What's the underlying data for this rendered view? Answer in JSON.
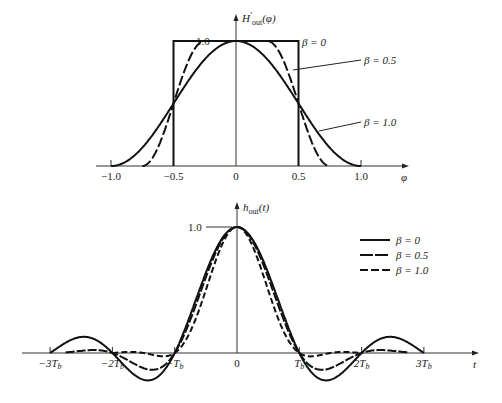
{
  "chart_data": [
    {
      "type": "line",
      "title": "",
      "ylabel": "H'out(φ)",
      "xlabel": "φ",
      "xlim": [
        -1.0,
        1.0
      ],
      "ylim": [
        0,
        1.0
      ],
      "x_ticks": [
        "-1.0",
        "-0.5",
        "0",
        "0.5",
        "1.0"
      ],
      "y_ticks": [
        "1.0"
      ],
      "grid": false,
      "series": [
        {
          "name": "β = 0",
          "style": "solid",
          "x": [
            -1.0,
            -0.5,
            -0.5,
            0,
            0.5,
            0.5,
            1.0
          ],
          "values": [
            0,
            0,
            1,
            1,
            1,
            0,
            0
          ]
        },
        {
          "name": "β = 0.5",
          "style": "long-dash",
          "x": [
            -0.75,
            -0.625,
            -0.5,
            -0.375,
            -0.25,
            0,
            0.25,
            0.375,
            0.5,
            0.625,
            0.75
          ],
          "values": [
            0,
            0.146,
            0.5,
            0.854,
            1,
            1,
            1,
            0.854,
            0.5,
            0.146,
            0
          ]
        },
        {
          "name": "β = 1.0",
          "style": "solid",
          "x": [
            -1.0,
            -0.75,
            -0.5,
            -0.25,
            0,
            0.25,
            0.5,
            0.75,
            1.0
          ],
          "values": [
            0,
            0.146,
            0.5,
            0.854,
            1,
            0.854,
            0.5,
            0.146,
            0
          ]
        }
      ],
      "annotations": [
        "β = 0",
        "β = 0.5",
        "β = 1.0"
      ]
    },
    {
      "type": "line",
      "title": "",
      "ylabel": "hout(t)",
      "xlabel": "t",
      "xlim": [
        -3,
        3
      ],
      "ylim": [
        -0.25,
        1.0
      ],
      "x_ticks": [
        "-3Tb",
        "-2Tb",
        "-Tb",
        "0",
        "Tb",
        "2Tb",
        "3Tb"
      ],
      "y_ticks": [
        "1.0"
      ],
      "grid": false,
      "legend_position": "upper right",
      "series": [
        {
          "name": "β = 0",
          "style": "solid",
          "x": [
            -3,
            -2.5,
            -2,
            -1.5,
            -1,
            -0.5,
            0,
            0.5,
            1,
            1.5,
            2,
            2.5,
            3
          ],
          "values": [
            0,
            0.127,
            0,
            -0.212,
            0,
            0.637,
            1,
            0.637,
            0,
            -0.212,
            0,
            0.127,
            0
          ]
        },
        {
          "name": "β = 0.5",
          "style": "long-dash",
          "x": [
            -2.5,
            -2,
            -1.5,
            -1,
            -0.5,
            0,
            0.5,
            1,
            1.5,
            2,
            2.5
          ],
          "values": [
            0.049,
            0,
            -0.123,
            0,
            0.707,
            1,
            0.707,
            0,
            -0.123,
            0,
            0.049
          ]
        },
        {
          "name": "β = 1.0",
          "style": "short-dash",
          "x": [
            -2,
            -1.5,
            -1,
            -0.5,
            0,
            0.5,
            1,
            1.5,
            2
          ],
          "values": [
            0,
            0.053,
            0,
            0.5,
            1,
            0.5,
            0,
            0.053,
            0
          ]
        }
      ]
    }
  ],
  "top": {
    "ylabel_main": "H",
    "ylabel_sup": "′",
    "ylabel_sub": "out",
    "ylabel_arg": "(φ)",
    "y_tick": "1.0",
    "x_axis_label": "φ",
    "x_ticks": [
      {
        "v": -1.0,
        "label": "−1.0"
      },
      {
        "v": -0.5,
        "label": "−0.5"
      },
      {
        "v": 0,
        "label": "0"
      },
      {
        "v": 0.5,
        "label": "0.5"
      },
      {
        "v": 1.0,
        "label": "1.0"
      }
    ],
    "annotations": {
      "b0": "β = 0",
      "b05": "β = 0.5",
      "b1": "β = 1.0"
    }
  },
  "bottom": {
    "ylabel_main": "h",
    "ylabel_sub": "out",
    "ylabel_arg": "(t)",
    "y_tick": "1.0",
    "x_axis_label": "t",
    "x_ticks": [
      {
        "v": -3,
        "label": "−3T",
        "sub": "b"
      },
      {
        "v": -2,
        "label": "−2T",
        "sub": "b"
      },
      {
        "v": -1,
        "label": "−T",
        "sub": "b"
      },
      {
        "v": 0,
        "label": "0",
        "sub": ""
      },
      {
        "v": 1,
        "label": "T",
        "sub": "b"
      },
      {
        "v": 2,
        "label": "2T",
        "sub": "b"
      },
      {
        "v": 3,
        "label": "3T",
        "sub": "b"
      }
    ],
    "legend": [
      {
        "label": "β = 0",
        "dash": ""
      },
      {
        "label": "β = 0.5",
        "dash": "9,2"
      },
      {
        "label": "β = 1.0",
        "dash": "6,3"
      }
    ]
  }
}
